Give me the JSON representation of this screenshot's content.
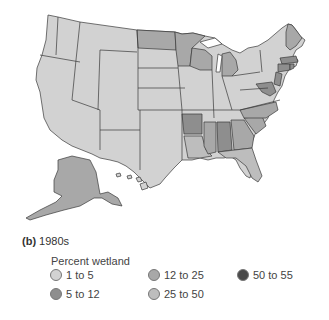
{
  "caption": {
    "label": "(b)",
    "text": "1980s"
  },
  "legend": {
    "title": "Percent wetland",
    "items": [
      {
        "label": "1 to 5",
        "color": "#d2d2d2"
      },
      {
        "label": "5 to 12",
        "color": "#8e8e8e"
      },
      {
        "label": "12 to 25",
        "color": "#a8a8a8"
      },
      {
        "label": "25 to 50",
        "color": "#bdbdbd"
      },
      {
        "label": "50 to 55",
        "color": "#4a4a4a"
      }
    ]
  },
  "map": {
    "title": "Percent wetland by state, 1980s",
    "default_class": "1 to 5",
    "regions": [
      {
        "name": "North Dakota",
        "class": "12 to 25"
      },
      {
        "name": "Minnesota",
        "class": "12 to 25"
      },
      {
        "name": "Wisconsin",
        "class": "12 to 25"
      },
      {
        "name": "Michigan",
        "class": "12 to 25"
      },
      {
        "name": "Arkansas",
        "class": "5 to 12"
      },
      {
        "name": "Mississippi",
        "class": "12 to 25"
      },
      {
        "name": "Alabama",
        "class": "5 to 12"
      },
      {
        "name": "Georgia",
        "class": "12 to 25"
      },
      {
        "name": "South Carolina",
        "class": "12 to 25"
      },
      {
        "name": "North Carolina",
        "class": "12 to 25"
      },
      {
        "name": "Louisiana",
        "class": "25 to 50"
      },
      {
        "name": "Florida",
        "class": "25 to 50"
      },
      {
        "name": "Maine",
        "class": "12 to 25"
      },
      {
        "name": "Massachusetts",
        "class": "5 to 12"
      },
      {
        "name": "Connecticut",
        "class": "5 to 12"
      },
      {
        "name": "Rhode Island",
        "class": "5 to 12"
      },
      {
        "name": "New Jersey",
        "class": "5 to 12"
      },
      {
        "name": "Delaware",
        "class": "5 to 12"
      },
      {
        "name": "Maryland",
        "class": "5 to 12"
      },
      {
        "name": "Alaska",
        "class": "12 to 25"
      },
      {
        "name": "Hawaii",
        "class": "1 to 5"
      }
    ]
  }
}
